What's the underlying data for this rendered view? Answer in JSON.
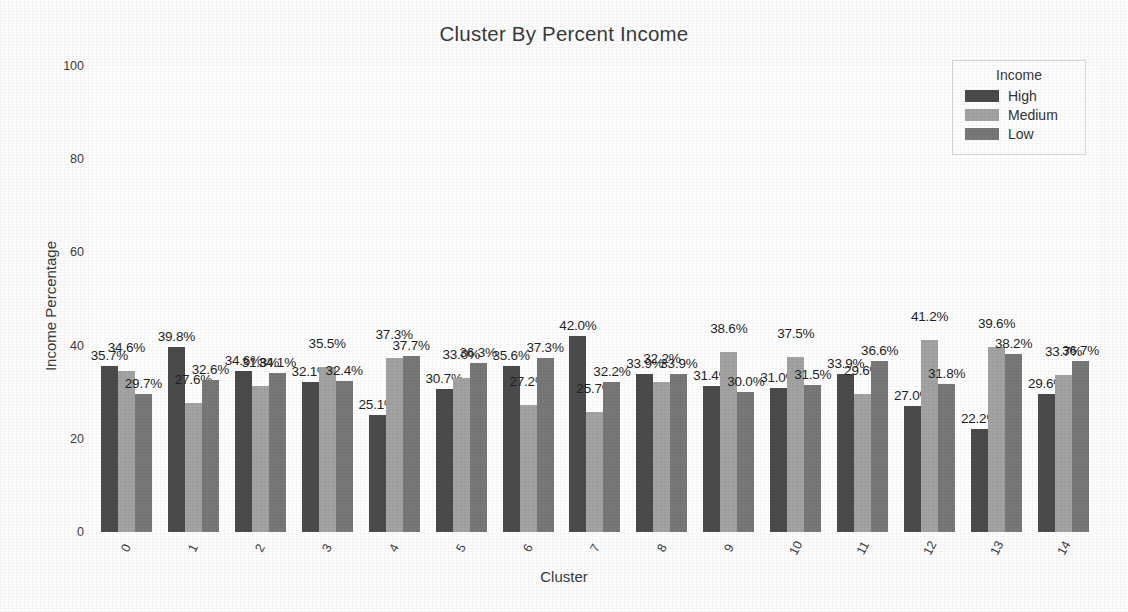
{
  "chart_data": {
    "type": "bar",
    "title": "Cluster By Percent Income",
    "xlabel": "Cluster",
    "ylabel": "Income Percentage",
    "ylim": [
      0,
      100
    ],
    "yticks": [
      0,
      20,
      40,
      60,
      80,
      100
    ],
    "grid": false,
    "legend_position": "upper-right",
    "legend_title": "Income",
    "categories": [
      "0",
      "1",
      "2",
      "3",
      "4",
      "5",
      "6",
      "7",
      "8",
      "9",
      "10",
      "11",
      "12",
      "13",
      "14"
    ],
    "series": [
      {
        "name": "High",
        "color": "#4b4b4b",
        "values": [
          35.7,
          39.8,
          34.6,
          32.1,
          25.1,
          30.7,
          35.6,
          42.0,
          33.9,
          31.4,
          31.0,
          33.9,
          27.0,
          22.2,
          29.6
        ],
        "labels": [
          "35.7%",
          "39.8%",
          "34.6%",
          "32.1%",
          "25.1%",
          "30.7%",
          "35.6%",
          "42.0%",
          "33.9%",
          "31.4%",
          "31.0%",
          "33.9%",
          "27.0%",
          "22.2%",
          "29.6%"
        ]
      },
      {
        "name": "Medium",
        "color": "#a3a3a3",
        "values": [
          34.6,
          27.6,
          31.3,
          35.5,
          37.3,
          33.0,
          27.2,
          25.7,
          32.2,
          38.6,
          37.5,
          29.6,
          41.2,
          39.6,
          33.7
        ],
        "labels": [
          "34.6%",
          "27.6%",
          "31.3%",
          "35.5%",
          "37.3%",
          "33.0%",
          "27.2%",
          "25.7%",
          "32.2%",
          "38.6%",
          "37.5%",
          "29.6%",
          "41.2%",
          "39.6%",
          "33.7%"
        ]
      },
      {
        "name": "Low",
        "color": "#787878",
        "values": [
          29.7,
          32.6,
          34.1,
          32.4,
          37.7,
          36.3,
          37.3,
          32.2,
          33.9,
          30.0,
          31.5,
          36.6,
          31.8,
          38.2,
          36.7
        ],
        "labels": [
          "29.7%",
          "32.6%",
          "34.1%",
          "32.4%",
          "37.7%",
          "36.3%",
          "37.3%",
          "32.2%",
          "33.9%",
          "30.0%",
          "31.5%",
          "36.6%",
          "31.8%",
          "38.2%",
          "36.7%"
        ]
      }
    ]
  }
}
